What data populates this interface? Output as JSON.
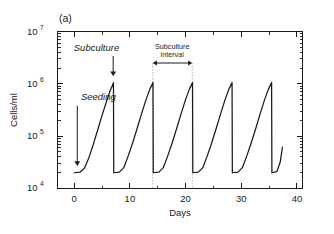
{
  "panel": {
    "label": "(a)"
  },
  "chart_data": {
    "type": "line",
    "title": "",
    "subtitle": "",
    "xlabel": "Days",
    "ylabel": "Cells/ml",
    "xlim": [
      -3,
      41
    ],
    "ylim": [
      10000,
      10000000
    ],
    "yscale": "log",
    "xscale": "linear",
    "grid": false,
    "legend": null,
    "xticks": [
      0,
      10,
      20,
      30,
      40
    ],
    "xtick_labels": [
      "0",
      "10",
      "20",
      "30",
      "40"
    ],
    "yticks": [
      10000,
      100000,
      1000000,
      10000000
    ],
    "ytick_labels": [
      "10⁴",
      "10⁵",
      "10⁶",
      "10⁷"
    ],
    "ytick_bases": [
      "10",
      "10",
      "10",
      "10"
    ],
    "ytick_exponents": [
      "4",
      "5",
      "6",
      "7"
    ],
    "series": [
      {
        "name": "Cell density",
        "description": "Repeated batch subculture sawtooth: seeding at 2e4 cells/ml, exponential growth to about 1e6 cells/ml over roughly 7 days, then dilution back to seeding density.",
        "x": [
          0.0,
          1.0,
          1.8,
          2.6,
          3.4,
          4.2,
          5.0,
          5.8,
          6.5,
          7.0,
          7.05,
          7.1,
          8.1,
          8.9,
          9.7,
          10.5,
          11.3,
          12.1,
          12.9,
          13.6,
          14.1,
          14.15,
          14.2,
          15.2,
          16.0,
          16.8,
          17.6,
          18.4,
          19.2,
          20.0,
          20.7,
          21.2,
          21.25,
          21.3,
          22.3,
          23.1,
          23.9,
          24.7,
          25.5,
          26.3,
          27.1,
          27.8,
          28.3,
          28.35,
          28.4,
          29.4,
          30.2,
          31.0,
          31.8,
          32.6,
          33.4,
          34.2,
          34.9,
          35.4,
          35.45,
          35.5,
          36.4,
          37.0,
          37.4
        ],
        "y": [
          20000,
          20500,
          24000,
          38000,
          68000,
          130000,
          250000,
          460000,
          760000,
          1000000,
          1050000,
          20000,
          20500,
          25000,
          42000,
          75000,
          140000,
          270000,
          500000,
          800000,
          1020000,
          1060000,
          20000,
          20500,
          25000,
          42000,
          75000,
          140000,
          270000,
          500000,
          800000,
          1020000,
          1060000,
          20000,
          20500,
          25000,
          42000,
          75000,
          140000,
          270000,
          500000,
          800000,
          1020000,
          1060000,
          20000,
          20500,
          25000,
          42000,
          75000,
          140000,
          270000,
          500000,
          800000,
          1020000,
          1060000,
          20000,
          21000,
          32000,
          62000
        ]
      }
    ],
    "annotations": [
      {
        "id": "seeding",
        "text": "Seeding",
        "style": "italic",
        "x_text": 1.2,
        "y_text": 500000,
        "arrow_x": 0.55,
        "arrow_from_y": 380000,
        "arrow_to_y": 27000,
        "direction": "down"
      },
      {
        "id": "subculture",
        "text": "Subculture",
        "style": "italic",
        "x_text": 4.0,
        "y_text": 4200000,
        "arrow_x": 7.0,
        "arrow_from_y": 3400000,
        "arrow_to_y": 1400000,
        "direction": "down"
      },
      {
        "id": "subculture-interval",
        "text_line1": "Subculture",
        "text_line2": "interval",
        "style": "plain",
        "x_text": 17.6,
        "y_text": 4700000,
        "bracket_x_start": 14.1,
        "bracket_x_end": 21.2,
        "bracket_y": 2500000,
        "guide_top_y": 2500000,
        "guide_bottom_y": 1050000,
        "direction": "double"
      }
    ]
  }
}
